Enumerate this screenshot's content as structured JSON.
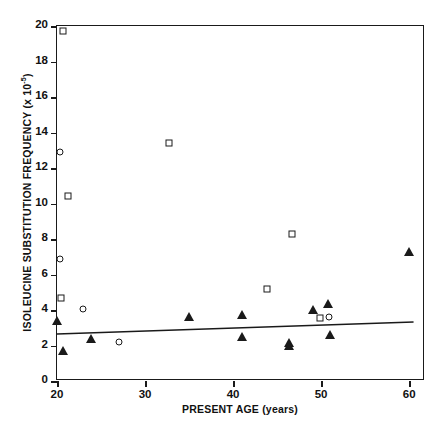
{
  "chart_data": {
    "type": "scatter",
    "title": "",
    "xlabel": "PRESENT AGE (years)",
    "ylabel": "ISOLEUCINE SUBSTITUTION FREQUENCY (x 10⁻⁵)",
    "ylabel_main": "ISOLEUCINE SUBSTITUTION FREQUENCY (x 10",
    "ylabel_exp": "-5",
    "ylabel_tail": ")",
    "xlim": [
      20,
      61.8
    ],
    "ylim": [
      0,
      20
    ],
    "xticks": [
      20,
      30,
      40,
      50,
      60
    ],
    "xtick_labels": [
      "20",
      "30",
      "40",
      "50",
      "60"
    ],
    "yticks": [
      0,
      2,
      4,
      6,
      8,
      10,
      12,
      14,
      16,
      18,
      20
    ],
    "ytick_labels": [
      "0",
      "2",
      "4",
      "6",
      "8",
      "10",
      "12",
      "14",
      "16",
      "18",
      "20"
    ],
    "grid": false,
    "legend": false,
    "marker_color": "#1a1a1a",
    "series": [
      {
        "name": "open-square",
        "marker": "square",
        "filled": false,
        "points": [
          {
            "x": 20.7,
            "y": 19.7
          },
          {
            "x": 21.2,
            "y": 10.4
          },
          {
            "x": 20.5,
            "y": 4.65
          },
          {
            "x": 32.7,
            "y": 13.4
          },
          {
            "x": 43.9,
            "y": 5.2
          },
          {
            "x": 46.7,
            "y": 8.3
          },
          {
            "x": 49.9,
            "y": 3.55
          }
        ]
      },
      {
        "name": "open-circle",
        "marker": "circle",
        "filled": false,
        "points": [
          {
            "x": 20.3,
            "y": 12.9
          },
          {
            "x": 20.3,
            "y": 6.9
          },
          {
            "x": 23.0,
            "y": 4.05
          },
          {
            "x": 27.0,
            "y": 2.2
          },
          {
            "x": 50.9,
            "y": 3.6
          }
        ]
      },
      {
        "name": "filled-triangle",
        "marker": "triangle",
        "filled": true,
        "points": [
          {
            "x": 20.0,
            "y": 3.4
          },
          {
            "x": 20.7,
            "y": 1.7
          },
          {
            "x": 23.9,
            "y": 2.35
          },
          {
            "x": 35.0,
            "y": 3.6
          },
          {
            "x": 41.0,
            "y": 3.7
          },
          {
            "x": 41.0,
            "y": 2.5
          },
          {
            "x": 46.3,
            "y": 2.15
          },
          {
            "x": 46.3,
            "y": 1.95
          },
          {
            "x": 49.1,
            "y": 4.0
          },
          {
            "x": 50.8,
            "y": 4.35
          },
          {
            "x": 51.0,
            "y": 2.6
          },
          {
            "x": 60.0,
            "y": 7.25
          }
        ]
      }
    ],
    "fit_line": {
      "name": "regression-line",
      "x0": 20.0,
      "y0": 2.65,
      "x1": 60.5,
      "y1": 3.32
    }
  }
}
